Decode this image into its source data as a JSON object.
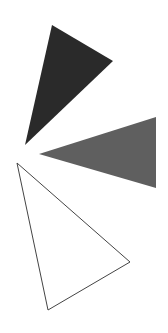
{
  "canvas": {
    "width": 168,
    "height": 333,
    "background": "#ffffff"
  },
  "shapes": [
    {
      "name": "dark-triangle",
      "points": "52,25 113,61 25,145",
      "fill": "#2a2a2a",
      "stroke": "none"
    },
    {
      "name": "gray-triangle",
      "points": "39,154 156,117 156,188",
      "fill": "#5f5f5f",
      "stroke": "none"
    },
    {
      "name": "outline-triangle",
      "points": "17,163 130,262 48,310",
      "fill": "#ffffff",
      "stroke": "#444444"
    }
  ]
}
